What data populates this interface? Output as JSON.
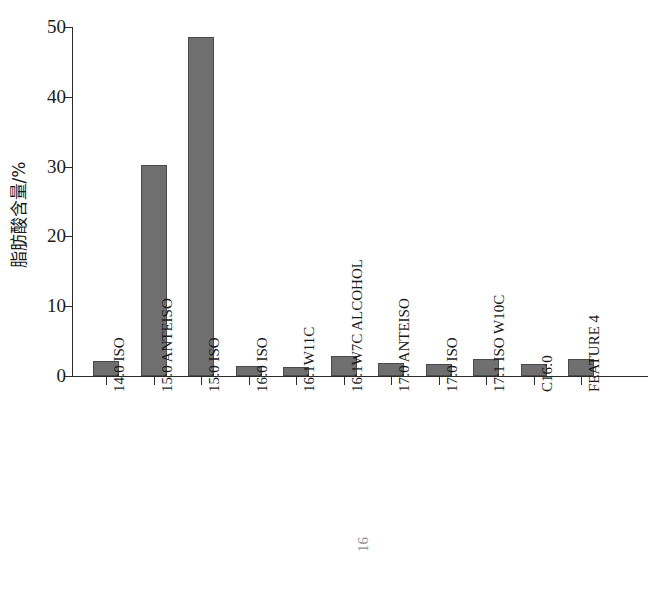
{
  "chart_data": {
    "type": "bar",
    "title": "",
    "xlabel": "",
    "ylabel": "脂肪酸含量/%",
    "ylim": [
      0,
      50
    ],
    "yticks": [
      0,
      10,
      20,
      30,
      40,
      50
    ],
    "ytick_labels": [
      "0",
      "10",
      "20",
      "30",
      "40",
      "50"
    ],
    "grid": false,
    "legend": null,
    "bar_color": "#6f6f6f",
    "bar_edge_color": "#4a4a4a",
    "axis_color": "#2b2b2b",
    "categories": [
      "14:0 ISO",
      "15:0 ANTEISO",
      "15:0 ISO",
      "16:0 ISO",
      "16:1W11C",
      "16:1W7C ALCOHOL",
      "17:0 ANTEISO",
      "17:0 ISO",
      "17:1 ISO W10C",
      "C16:0",
      "FEATURE 4"
    ],
    "values": [
      2.2,
      30.2,
      48.6,
      1.5,
      1.3,
      2.9,
      1.9,
      1.7,
      2.4,
      1.7,
      2.4
    ],
    "units": "%"
  },
  "artifact": {
    "scan_mark": "16"
  }
}
